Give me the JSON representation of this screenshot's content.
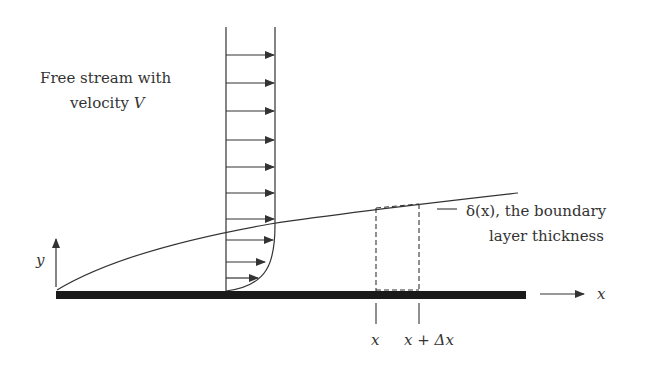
{
  "labels": {
    "free_stream_line1": "Free stream with",
    "free_stream_line2": "velocity ",
    "free_stream_var": "V",
    "delta_line1": "δ(x),  the boundary",
    "delta_line2": "layer thickness",
    "y_axis": "y",
    "x_axis": "x",
    "x_tick": "x",
    "x_dx_tick": "x + Δx"
  },
  "colors": {
    "ink": "#333333",
    "plate": "#1a1a1a",
    "background": "#ffffff"
  },
  "geometry": {
    "plate": {
      "x1": 56,
      "x2": 526,
      "y_top": 291,
      "thickness": 8
    },
    "profile_station": {
      "x_wall": 226,
      "x_freestream": 275,
      "top": 27
    },
    "arrow_rows_y": [
      55,
      83,
      111,
      140,
      167,
      193,
      219,
      240,
      262,
      278
    ],
    "control_volume": {
      "x1": 376,
      "x2": 419,
      "top": 208,
      "bottom": 291
    },
    "boundary_curve_end": {
      "x": 518,
      "y": 193
    }
  }
}
